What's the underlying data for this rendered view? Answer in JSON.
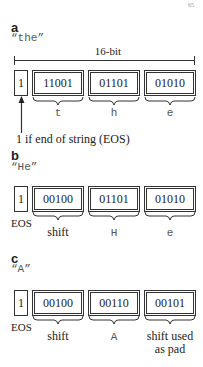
{
  "corner_mark": "65",
  "panels": [
    {
      "label": "a",
      "string": "“the”",
      "width_label": "16-bit",
      "eos_bit": "1",
      "codes": [
        "11001",
        "01101",
        "01010"
      ],
      "chars": [
        "t",
        "h",
        "e"
      ],
      "annotation": "1 if end of string (EOS)"
    },
    {
      "label": "b",
      "string": "“He”",
      "eos_bit": "1",
      "eos_label": "EOS",
      "codes": [
        "00100",
        "01101",
        "01010"
      ],
      "chars": [
        "shift",
        "H",
        "e"
      ]
    },
    {
      "label": "c",
      "string": "“A”",
      "eos_bit": "1",
      "eos_label": "EOS",
      "codes": [
        "00100",
        "00110",
        "00101"
      ],
      "chars": [
        "shift",
        "A",
        "shift used",
        "as pad"
      ]
    }
  ]
}
